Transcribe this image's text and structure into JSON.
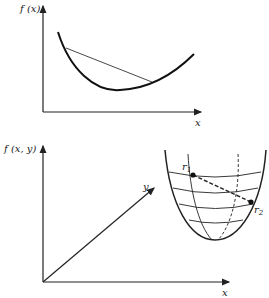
{
  "figure_top": {
    "y_axis_label": "f (x)",
    "x_axis_label": "x",
    "description": "convex function f(x) with chord lying above curve"
  },
  "figure_bottom": {
    "z_axis_label": "f (x, y)",
    "y_axis_label": "y",
    "x_axis_label": "x",
    "point1_label": "r",
    "point1_sub": "1",
    "point2_label": "r",
    "point2_sub": "2",
    "description": "convex bowl surface f(x,y) with dashed segment between r1 and r2"
  }
}
